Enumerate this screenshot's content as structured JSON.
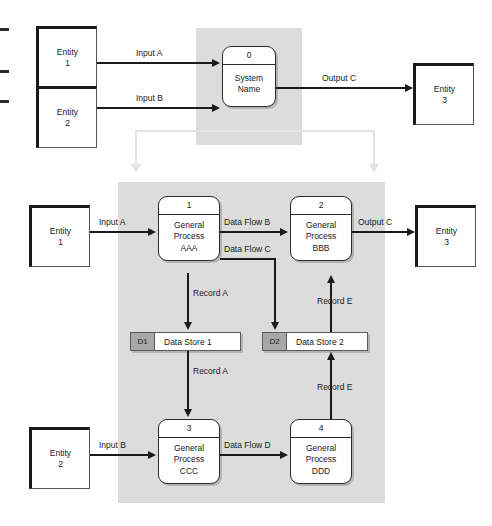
{
  "diagram": {
    "colors": {
      "panel_gray": "#dcdcdc",
      "datastore_id_gray": "#a8a8a8",
      "connector_black": "#1a1a1a",
      "decomposition_connector_gray": "#e4e4e4",
      "shape_fill": "#ffffff"
    }
  },
  "context_diagram": {
    "entities": [
      {
        "id": "entity-1",
        "line1": "Entity",
        "line2": "1"
      },
      {
        "id": "entity-2",
        "line1": "Entity",
        "line2": "2"
      },
      {
        "id": "entity-3",
        "line1": "Entity",
        "line2": "3"
      }
    ],
    "process": {
      "number": "0",
      "name_line1": "System",
      "name_line2": "Name"
    },
    "flows": [
      {
        "id": "ctx-input-a",
        "label": "Input A"
      },
      {
        "id": "ctx-input-b",
        "label": "Input B"
      },
      {
        "id": "ctx-output-c",
        "label": "Output C"
      }
    ]
  },
  "level0_diagram": {
    "entities": [
      {
        "id": "entity-1",
        "line1": "Entity",
        "line2": "1"
      },
      {
        "id": "entity-2",
        "line1": "Entity",
        "line2": "2"
      },
      {
        "id": "entity-3",
        "line1": "Entity",
        "line2": "3"
      }
    ],
    "processes": [
      {
        "number": "1",
        "name_line1": "General",
        "name_line2": "Process",
        "name_line3": "AAA"
      },
      {
        "number": "2",
        "name_line1": "General",
        "name_line2": "Process",
        "name_line3": "BBB"
      },
      {
        "number": "3",
        "name_line1": "General",
        "name_line2": "Process",
        "name_line3": "CCC"
      },
      {
        "number": "4",
        "name_line1": "General",
        "name_line2": "Process",
        "name_line3": "DDD"
      }
    ],
    "data_stores": [
      {
        "id": "D1",
        "label": "Data Store 1"
      },
      {
        "id": "D2",
        "label": "Data Store 2"
      }
    ],
    "flows": [
      {
        "id": "l0-input-a",
        "label": "Input A"
      },
      {
        "id": "l0-input-b",
        "label": "Input B"
      },
      {
        "id": "l0-data-flow-b",
        "label": "Data Flow B"
      },
      {
        "id": "l0-data-flow-c",
        "label": "Data Flow C"
      },
      {
        "id": "l0-data-flow-d",
        "label": "Data Flow D"
      },
      {
        "id": "l0-output-c",
        "label": "Output C"
      },
      {
        "id": "l0-record-a-in",
        "label": "Record A"
      },
      {
        "id": "l0-record-a-out",
        "label": "Record A"
      },
      {
        "id": "l0-record-e-in",
        "label": "Record E"
      },
      {
        "id": "l0-record-e-out",
        "label": "Record E"
      }
    ]
  }
}
